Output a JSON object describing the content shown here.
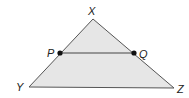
{
  "diagram": {
    "type": "triangle-with-midsegment",
    "colors": {
      "fill": "#e6e6e6",
      "stroke": "#555555",
      "point": "#111111"
    },
    "vertices": {
      "X": {
        "label": "X",
        "x": 93,
        "y": 19
      },
      "Y": {
        "label": "Y",
        "x": 29,
        "y": 87
      },
      "Z": {
        "label": "Z",
        "x": 174,
        "y": 88
      }
    },
    "points": {
      "P": {
        "label": "P",
        "x": 60,
        "y": 53
      },
      "Q": {
        "label": "Q",
        "x": 134,
        "y": 53
      }
    },
    "segments": [
      "XY",
      "YZ",
      "XZ",
      "PQ"
    ]
  }
}
